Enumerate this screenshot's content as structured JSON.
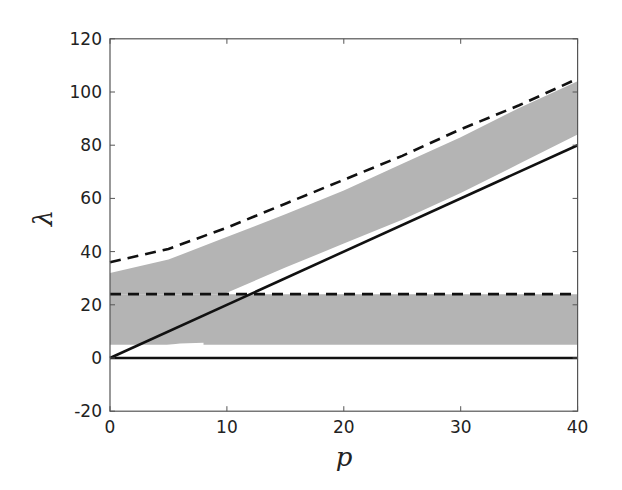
{
  "chart_data": {
    "type": "line",
    "title": "",
    "xlabel": "p",
    "ylabel": "λ",
    "xlim": [
      0,
      40
    ],
    "ylim": [
      -20,
      120
    ],
    "xticks": [
      0,
      10,
      20,
      30,
      40
    ],
    "yticks": [
      -20,
      0,
      20,
      40,
      60,
      80,
      100,
      120
    ],
    "grid": false,
    "legend": null,
    "series": [
      {
        "name": "solid horizontal line",
        "style": "solid",
        "color": "#111111",
        "x": [
          0,
          40
        ],
        "y": [
          0,
          0
        ]
      },
      {
        "name": "solid diagonal line",
        "style": "solid",
        "color": "#111111",
        "x": [
          0,
          40
        ],
        "y": [
          0,
          80
        ]
      },
      {
        "name": "dashed horizontal bound",
        "style": "dashed",
        "color": "#111111",
        "x": [
          0,
          40
        ],
        "y": [
          24,
          24
        ]
      },
      {
        "name": "dashed upper bound",
        "style": "dashed",
        "color": "#111111",
        "x": [
          0,
          5,
          10,
          15,
          20,
          25,
          30,
          35,
          40
        ],
        "y": [
          36,
          41,
          49,
          58,
          67,
          76,
          86,
          95,
          105
        ]
      }
    ],
    "shaded_regions": [
      {
        "name": "lower band",
        "color": "#b4b4b4",
        "x": [
          0,
          40
        ],
        "lower": [
          5,
          5
        ],
        "upper": [
          24,
          24
        ]
      },
      {
        "name": "upper band",
        "color": "#b4b4b4",
        "x": [
          0,
          5,
          9.7,
          15,
          20,
          25,
          30,
          35,
          40
        ],
        "lower": [
          24,
          24,
          24,
          34,
          43,
          52,
          62,
          73,
          84
        ],
        "upper": [
          32,
          37,
          45,
          54,
          63,
          73,
          83,
          94,
          104
        ]
      }
    ],
    "annotations": [
      {
        "name": "thin white curve near origin",
        "x": [
          0,
          3,
          6,
          8
        ],
        "y": [
          0.5,
          3.5,
          5,
          5.3
        ]
      }
    ]
  }
}
